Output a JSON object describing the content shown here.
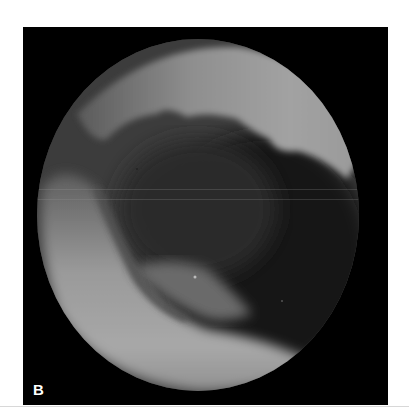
{
  "figure": {
    "panel_label": "B",
    "colors": {
      "background": "#000000",
      "tissue_bright": "#a8a8a8",
      "tissue_mid": "#6e6e6e",
      "lumen_dark": "#151515",
      "label": "#ffffff",
      "page": "#ffffff"
    }
  }
}
